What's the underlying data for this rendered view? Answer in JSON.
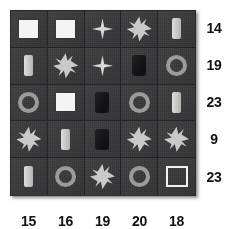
{
  "puzzle": {
    "type": "shape-sum-grid",
    "rows": 5,
    "columns": 5,
    "row_sums": [
      "14",
      "19",
      "23",
      "9",
      "23"
    ],
    "column_sums": [
      "15",
      "16",
      "19",
      "20",
      "18"
    ],
    "cells": [
      [
        {
          "shape": "square-filled-icon"
        },
        {
          "shape": "square-filled-icon"
        },
        {
          "shape": "star-4-point-icon"
        },
        {
          "shape": "star-8-point-icon"
        },
        {
          "shape": "bar-vertical-light-icon"
        }
      ],
      [
        {
          "shape": "bar-vertical-light-icon"
        },
        {
          "shape": "star-8-point-icon"
        },
        {
          "shape": "star-4-point-icon"
        },
        {
          "shape": "rectangle-dark-icon"
        },
        {
          "shape": "ring-icon"
        }
      ],
      [
        {
          "shape": "ring-icon"
        },
        {
          "shape": "square-filled-icon"
        },
        {
          "shape": "rectangle-dark-icon"
        },
        {
          "shape": "ring-icon"
        },
        {
          "shape": "bar-vertical-light-icon"
        }
      ],
      [
        {
          "shape": "star-8-point-icon"
        },
        {
          "shape": "bar-vertical-light-icon"
        },
        {
          "shape": "rectangle-dark-icon"
        },
        {
          "shape": "star-8-point-icon"
        },
        {
          "shape": "star-8-point-icon"
        }
      ],
      [
        {
          "shape": "bar-vertical-light-icon"
        },
        {
          "shape": "ring-icon"
        },
        {
          "shape": "star-8-point-icon"
        },
        {
          "shape": "ring-icon"
        },
        {
          "shape": "square-hollow-icon"
        }
      ]
    ]
  },
  "colors": {
    "board_background": "#37373a",
    "cell_background": "#3a3a3c",
    "grid_line": "#232325",
    "shape_light": "#f4f4f2",
    "shape_gray": "#c9c9c7",
    "shape_ring": "#9b9b99",
    "shape_dark": "#17171a",
    "label_text": "#111111",
    "page_background": "#ffffff"
  }
}
